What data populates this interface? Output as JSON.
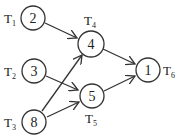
{
  "diagram": {
    "type": "task-dependency-graph",
    "nodes": [
      {
        "id": "n2",
        "value": "2",
        "task": "T",
        "sub": "1",
        "cx": 33,
        "cy": 18,
        "label_pos": "left"
      },
      {
        "id": "n3",
        "value": "3",
        "task": "T",
        "sub": "2",
        "cx": 34,
        "cy": 71,
        "label_pos": "left"
      },
      {
        "id": "n8",
        "value": "8",
        "task": "T",
        "sub": "3",
        "cx": 34,
        "cy": 122,
        "label_pos": "left"
      },
      {
        "id": "n4",
        "value": "4",
        "task": "T",
        "sub": "4",
        "cx": 91,
        "cy": 44,
        "label_pos": "top"
      },
      {
        "id": "n5",
        "value": "5",
        "task": "T",
        "sub": "5",
        "cx": 92,
        "cy": 96,
        "label_pos": "bottom"
      },
      {
        "id": "n1",
        "value": "1",
        "task": "T",
        "sub": "6",
        "cx": 148,
        "cy": 70,
        "label_pos": "right"
      }
    ],
    "edges": [
      {
        "from": "T1",
        "to": "T4"
      },
      {
        "from": "T2",
        "to": "T5"
      },
      {
        "from": "T3",
        "to": "T4"
      },
      {
        "from": "T3",
        "to": "T5"
      },
      {
        "from": "T4",
        "to": "T6"
      },
      {
        "from": "T5",
        "to": "T6"
      }
    ],
    "colors": {
      "stroke": "#333333",
      "text": "#222222",
      "background": "#ffffff"
    }
  }
}
